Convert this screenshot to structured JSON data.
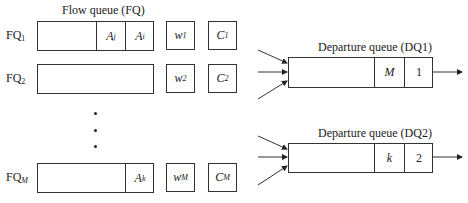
{
  "flow_queue": {
    "title": "Flow queue (FQ)",
    "rows": [
      {
        "label": "FQ",
        "label_sub": "1",
        "cells": [
          {
            "main": "A",
            "sub": "j"
          },
          {
            "main": "A",
            "sub": "i"
          }
        ],
        "weight": {
          "main": "w",
          "sub": "1"
        },
        "credit": {
          "main": "C",
          "sub": "1"
        }
      },
      {
        "label": "FQ",
        "label_sub": "2",
        "cells": [],
        "weight": {
          "main": "w",
          "sub": "2"
        },
        "credit": {
          "main": "C",
          "sub": "2"
        }
      },
      {
        "label": "FQ",
        "label_sub": "M",
        "cells": [
          {
            "main": "A",
            "sub": "k"
          }
        ],
        "weight": {
          "main": "w",
          "sub": "M"
        },
        "credit": {
          "main": "C",
          "sub": "M"
        }
      }
    ],
    "ellipsis": "⋮"
  },
  "departure_queues": [
    {
      "title": "Departure queue (DQ1)",
      "cells": [
        "M",
        "1"
      ]
    },
    {
      "title": "Departure queue (DQ2)",
      "cells": [
        "k",
        "2"
      ]
    }
  ]
}
